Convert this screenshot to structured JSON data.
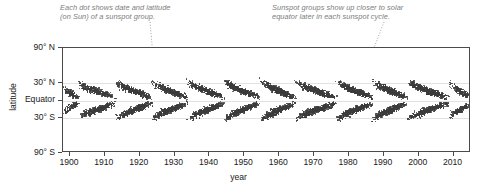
{
  "figure": {
    "caption_1": "Each dot shows date and latitude\n(on Sun) of a sunspot group.",
    "caption_2": "Sunspot groups show up closer to solar\nequator later in each sunspot cycle.",
    "dot_color": "#3b3b3b",
    "annotation_color": "#7d7d7d",
    "axis_color": "#4a4a4a"
  },
  "chart_data": {
    "type": "scatter",
    "title": "",
    "xlabel": "year",
    "ylabel": "latitude",
    "xlim": [
      1898,
      2015
    ],
    "ylim": [
      -90,
      90
    ],
    "grid": true,
    "legend": "none",
    "xticks": [
      1900,
      1910,
      1920,
      1930,
      1940,
      1950,
      1960,
      1970,
      1980,
      1990,
      2000,
      2010
    ],
    "xticklabels": [
      "1900",
      "1910",
      "1920",
      "1930",
      "1940",
      "1950",
      "1960",
      "1970",
      "1980",
      "1990",
      "2000",
      "2010"
    ],
    "yticks": [
      90,
      30,
      0,
      -30,
      -90
    ],
    "yticklabels": [
      "90° N",
      "30° N",
      "Equator",
      "30° S",
      "90° S"
    ],
    "gridlines_at": [
      30,
      0,
      -30
    ],
    "series": [
      {
        "name": "sunspot groups",
        "marker": "dot",
        "color": "#3b3b3b",
        "cycles": [
          {
            "number": 13,
            "start": 1898.0,
            "end": 1902.6,
            "peak": 1899.0,
            "max_lat": 22,
            "min_lat": 5,
            "density": 0.58
          },
          {
            "number": 14,
            "start": 1902.0,
            "end": 1913.2,
            "peak": 1906.1,
            "max_lat": 31,
            "min_lat": 5,
            "density": 0.72
          },
          {
            "number": 15,
            "start": 1913.0,
            "end": 1923.6,
            "peak": 1917.6,
            "max_lat": 32,
            "min_lat": 5,
            "density": 0.86
          },
          {
            "number": 16,
            "start": 1923.2,
            "end": 1933.8,
            "peak": 1928.4,
            "max_lat": 33,
            "min_lat": 5,
            "density": 0.84
          },
          {
            "number": 17,
            "start": 1933.4,
            "end": 1944.4,
            "peak": 1937.4,
            "max_lat": 34,
            "min_lat": 5,
            "density": 0.95
          },
          {
            "number": 18,
            "start": 1944.0,
            "end": 1954.4,
            "peak": 1947.5,
            "max_lat": 34,
            "min_lat": 5,
            "density": 1.0
          },
          {
            "number": 19,
            "start": 1954.2,
            "end": 1964.8,
            "peak": 1958.2,
            "max_lat": 35,
            "min_lat": 5,
            "density": 1.1
          },
          {
            "number": 20,
            "start": 1964.4,
            "end": 1976.6,
            "peak": 1968.9,
            "max_lat": 33,
            "min_lat": 5,
            "density": 0.9
          },
          {
            "number": 21,
            "start": 1976.2,
            "end": 1986.8,
            "peak": 1979.9,
            "max_lat": 34,
            "min_lat": 5,
            "density": 1.05
          },
          {
            "number": 22,
            "start": 1986.4,
            "end": 1996.8,
            "peak": 1989.6,
            "max_lat": 34,
            "min_lat": 5,
            "density": 1.02
          },
          {
            "number": 23,
            "start": 1996.4,
            "end": 2008.8,
            "peak": 2000.3,
            "max_lat": 33,
            "min_lat": 5,
            "density": 0.88
          },
          {
            "number": 24,
            "start": 2008.6,
            "end": 2015.0,
            "peak": 2013.0,
            "max_lat": 30,
            "min_lat": 6,
            "density": 0.62
          }
        ]
      }
    ]
  }
}
